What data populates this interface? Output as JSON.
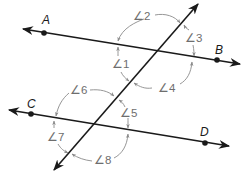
{
  "diagram": {
    "colors": {
      "line": "#1a1a1a",
      "angle_mark": "#8a8a8a",
      "angle_text": "#6e6e6e",
      "background": "#ffffff"
    },
    "points": {
      "A": {
        "label": "A",
        "x": 44,
        "y": 33
      },
      "B": {
        "label": "B",
        "x": 217,
        "y": 60
      },
      "C": {
        "label": "C",
        "x": 31,
        "y": 114
      },
      "D": {
        "label": "D",
        "x": 205,
        "y": 143
      }
    },
    "lines": [
      {
        "name": "line AB",
        "from": [
          23,
          29
        ],
        "to": [
          240,
          64
        ]
      },
      {
        "name": "line CD",
        "from": [
          9,
          110
        ],
        "to": [
          229,
          146
        ]
      },
      {
        "name": "transversal",
        "from": [
          54,
          170
        ],
        "to": [
          198,
          4
        ]
      }
    ],
    "angles": [
      {
        "label": "∠2",
        "number": 2
      },
      {
        "label": "∠3",
        "number": 3
      },
      {
        "label": "∠1",
        "number": 1
      },
      {
        "label": "∠4",
        "number": 4
      },
      {
        "label": "∠6",
        "number": 6
      },
      {
        "label": "∠5",
        "number": 5
      },
      {
        "label": "∠7",
        "number": 7
      },
      {
        "label": "∠8",
        "number": 8
      }
    ]
  }
}
